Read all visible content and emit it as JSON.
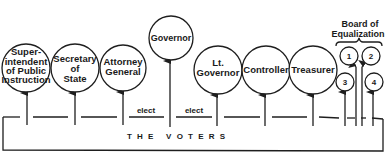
{
  "diagram": {
    "type": "organization-chart",
    "offices": [
      {
        "id": "superintendent",
        "lines": [
          "Super-",
          "intendent",
          "of Public",
          "Instruction"
        ]
      },
      {
        "id": "secretary-of-state",
        "lines": [
          "Secretary",
          "of",
          "State"
        ]
      },
      {
        "id": "attorney-general",
        "lines": [
          "Attorney",
          "General"
        ]
      },
      {
        "id": "governor",
        "lines": [
          "Governor"
        ]
      },
      {
        "id": "lt-governor",
        "lines": [
          "Lt.",
          "Governor"
        ]
      },
      {
        "id": "controller",
        "lines": [
          "Controller"
        ]
      },
      {
        "id": "treasurer",
        "lines": [
          "Treasurer"
        ]
      }
    ],
    "board": {
      "title_line1": "Board of",
      "title_line2": "Equalization",
      "members": [
        "1",
        "2",
        "3",
        "4"
      ]
    },
    "edge_labels": [
      "elect",
      "elect"
    ],
    "source_label": "T H E   V O T E R S"
  }
}
